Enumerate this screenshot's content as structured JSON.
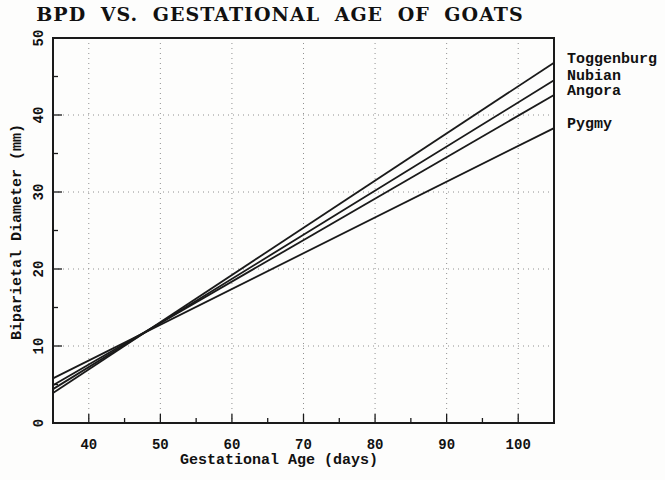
{
  "chart_data": {
    "type": "line",
    "title": "BPD VS. GESTATIONAL AGE OF GOATS",
    "xlabel": "Gestational Age (days)",
    "ylabel": "Biparietal Diameter (mm)",
    "xlim": [
      35,
      105
    ],
    "ylim": [
      0,
      50
    ],
    "x_major_ticks": [
      40,
      50,
      60,
      70,
      80,
      90,
      100
    ],
    "x_minor_step": 5,
    "y_major_ticks": [
      0,
      10,
      20,
      30,
      40,
      50
    ],
    "y_minor_step": 5,
    "grid": "dotted gridlines at major ticks, both axes",
    "legend_position": "outside-right, at line ends",
    "series": [
      {
        "name": "Toggenburg",
        "x": [
          35,
          105
        ],
        "y": [
          3.9,
          46.8
        ]
      },
      {
        "name": "Nubian",
        "x": [
          35,
          105
        ],
        "y": [
          4.4,
          44.5
        ]
      },
      {
        "name": "Angora",
        "x": [
          35,
          105
        ],
        "y": [
          4.9,
          42.6
        ]
      },
      {
        "name": "Pygmy",
        "x": [
          35,
          105
        ],
        "y": [
          5.8,
          38.3
        ]
      }
    ],
    "colors": {
      "line": "#1a1a1a",
      "frame": "#1a1a1a",
      "grid": "#909090",
      "text": "#111111",
      "background": "#fdfdfc"
    }
  }
}
